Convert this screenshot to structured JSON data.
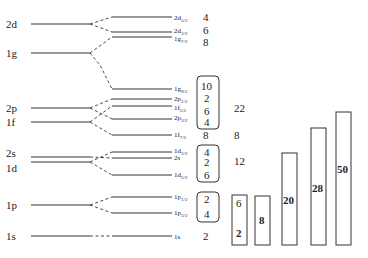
{
  "diagram": {
    "left_levels": [
      {
        "label": "2d",
        "y": 24
      },
      {
        "label": "1g",
        "y": 53
      },
      {
        "label": "2p",
        "y": 108
      },
      {
        "label": "1f",
        "y": 122
      },
      {
        "label": "2s",
        "y": 157
      },
      {
        "label": "1d",
        "y": 162
      },
      {
        "label": "1p",
        "y": 205
      },
      {
        "label": "1s",
        "y": 236
      }
    ],
    "right_levels": [
      {
        "main": "2d",
        "sub": "5/2",
        "y": 17,
        "occupancy": "4"
      },
      {
        "main": "2d",
        "sub": "3/2",
        "y": 32,
        "occupancy": "6"
      },
      {
        "main": "1g",
        "sub": "7/2",
        "y": 37,
        "occupancy": "8"
      },
      {
        "main": "1g",
        "sub": "9/2",
        "y": 89,
        "occupancy": "10"
      },
      {
        "main": "2p",
        "sub": "1/2",
        "y": 99,
        "occupancy": "2"
      },
      {
        "main": "1f",
        "sub": "5/2",
        "y": 106,
        "occupancy": "6"
      },
      {
        "main": "2p",
        "sub": "3/2",
        "y": 119,
        "occupancy": "4"
      },
      {
        "main": "1f",
        "sub": "7/2",
        "y": 135,
        "occupancy": "8"
      },
      {
        "main": "1d",
        "sub": "3/2",
        "y": 152,
        "occupancy": "4"
      },
      {
        "main": "2s",
        "sub": "",
        "y": 158,
        "occupancy": "2"
      },
      {
        "main": "1d",
        "sub": "5/2",
        "y": 175,
        "occupancy": "6"
      },
      {
        "main": "1p",
        "sub": "1/2",
        "y": 197,
        "occupancy": "2"
      },
      {
        "main": "1p",
        "sub": "3/2",
        "y": 213,
        "occupancy": "4"
      },
      {
        "main": "1s",
        "sub": "",
        "y": 236,
        "occupancy": "2"
      }
    ],
    "shell_totals": [
      {
        "value": "22",
        "y": 107
      },
      {
        "value": "8",
        "y": 135
      },
      {
        "value": "12",
        "y": 161
      }
    ],
    "magic_bars": [
      {
        "label": "2",
        "extra": "6",
        "x": 232,
        "top": 195,
        "bottom": 245
      },
      {
        "label": "8",
        "extra": "",
        "x": 255,
        "top": 196,
        "bottom": 245
      },
      {
        "label": "20",
        "extra": "",
        "x": 282,
        "top": 153,
        "bottom": 245
      },
      {
        "label": "28",
        "extra": "",
        "x": 311,
        "top": 128,
        "bottom": 245
      },
      {
        "label": "50",
        "extra": "",
        "x": 336,
        "top": 112,
        "bottom": 245
      }
    ]
  }
}
